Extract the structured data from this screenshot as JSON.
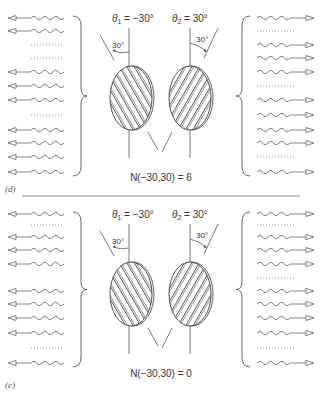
{
  "panels": [
    {
      "id": "d",
      "tag": "(d)",
      "theta1_label": "θ",
      "theta1_sub": "1",
      "theta1_value": " = −30°",
      "theta2_label": "θ",
      "theta2_sub": "2",
      "theta2_value": " = 30°",
      "angle1_label": "30°",
      "angle2_label": "30°",
      "result_label": "N(−30,30) = 6",
      "left_rows": [
        "photon",
        "photon",
        "dots",
        "dots",
        "photon",
        "photon",
        "photon",
        "dots",
        "photon",
        "photon",
        "photon",
        "photon"
      ],
      "right_rows": [
        "photon",
        "dots",
        "photon",
        "photon",
        "photon",
        "dots",
        "photon",
        "photon",
        "photon",
        "photon",
        "dots",
        "photon"
      ]
    },
    {
      "id": "e",
      "tag": "(e)",
      "theta1_label": "θ",
      "theta1_sub": "1",
      "theta1_value": " = −30°",
      "theta2_label": "θ",
      "theta2_sub": "2",
      "theta2_value": " = 30°",
      "angle1_label": "30°",
      "angle2_label": "30°",
      "result_label": "N(−30,30) = 0",
      "left_rows": [
        "photon",
        "dots",
        "photon",
        "photon",
        "photon",
        "blank",
        "photon",
        "photon",
        "photon",
        "photon",
        "dots",
        "photon"
      ],
      "right_rows": [
        "photon",
        "dots",
        "photon",
        "photon",
        "photon",
        "dots",
        "photon",
        "photon",
        "photon",
        "photon",
        "dots",
        "photon"
      ]
    }
  ],
  "colors": {
    "line": "#555555",
    "wave": "#666666",
    "hatch": "#444444",
    "text": "#333333",
    "divider": "#777777"
  }
}
